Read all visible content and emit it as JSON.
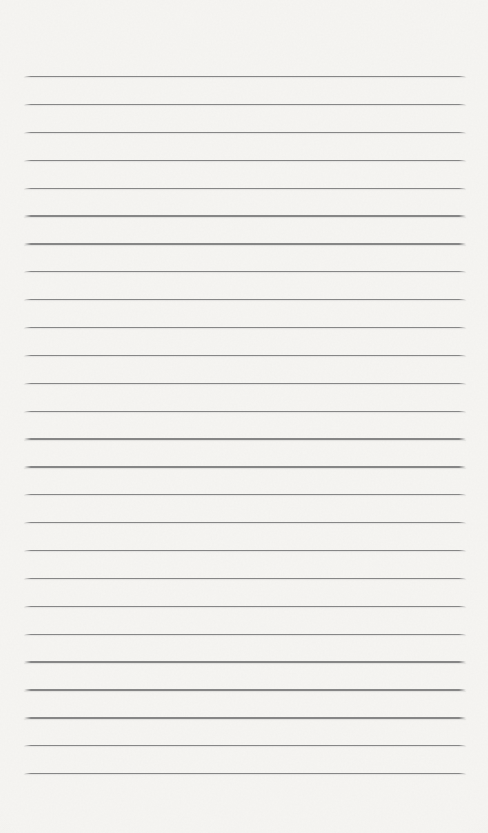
{
  "page": {
    "kind": "blank-ruled-notebook-page",
    "text_content": "",
    "background_color": "#f6f5f2",
    "rule_color": "#868686",
    "ruled_lines": {
      "count": 26,
      "first_line_top_px": 76,
      "spacing_px": 27.88,
      "left_px": 24,
      "right_px": 466,
      "thickness_px": 1.3
    }
  }
}
